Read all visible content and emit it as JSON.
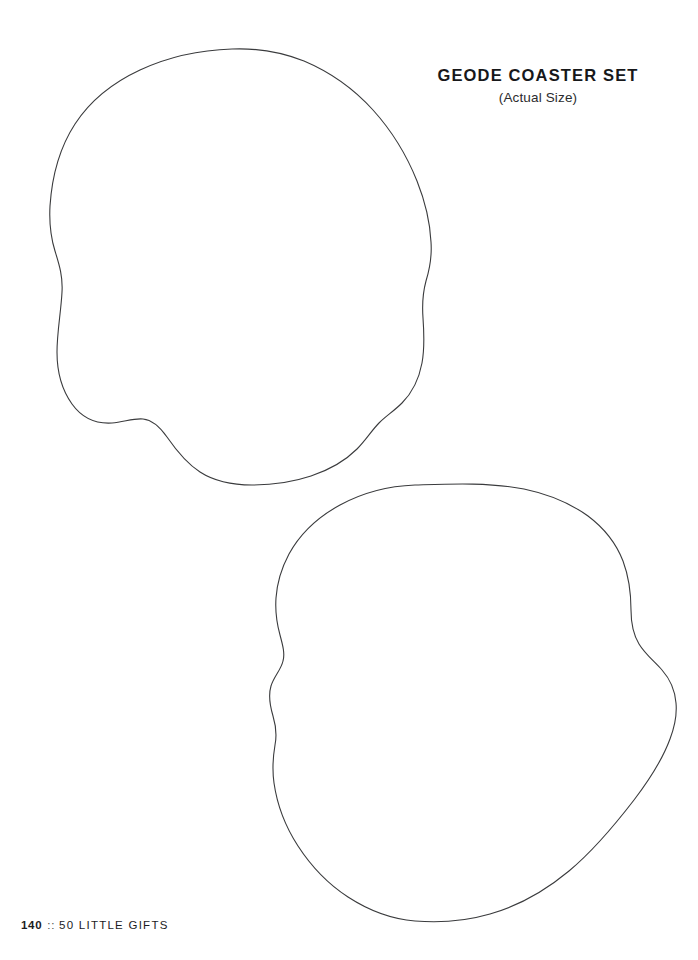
{
  "page": {
    "background_color": "#ffffff",
    "width": 698,
    "height": 960
  },
  "heading": {
    "title": "GEODE COASTER SET",
    "subtitle": "(Actual Size)",
    "title_color": "#17181a"
  },
  "footer": {
    "page_number": "140",
    "separator": "::",
    "book_title": "50 LITTLE GIFTS"
  },
  "template": {
    "stroke_color": "#3a3b3d",
    "stroke_width": 1.1,
    "fill": "none",
    "shapes": [
      {
        "name": "geode-coaster-outline-top",
        "label": "Upper geode coaster cut line",
        "bounds": {
          "x": 50,
          "y": 49,
          "width": 382,
          "height": 435
        }
      },
      {
        "name": "geode-coaster-outline-bottom",
        "label": "Lower geode coaster cut line",
        "bounds": {
          "x": 271,
          "y": 484,
          "width": 405,
          "height": 438
        }
      }
    ]
  }
}
